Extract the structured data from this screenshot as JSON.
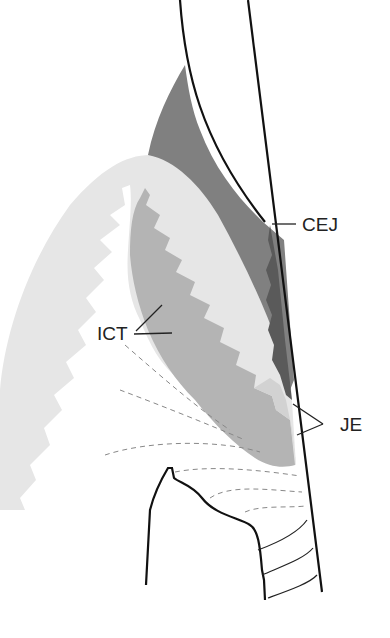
{
  "diagram": {
    "labels": {
      "cej": "CEJ",
      "ict": "ICT",
      "je": "JE"
    },
    "colors": {
      "enamel_space": "#ffffff",
      "dark_tissue": "#808080",
      "darker_band": "#5e5e5e",
      "oral_epithelium": "#e6e6e6",
      "connective_tissue": "#b4b4b4",
      "outline": "#111111",
      "dashed_fibers": "#888888"
    }
  }
}
